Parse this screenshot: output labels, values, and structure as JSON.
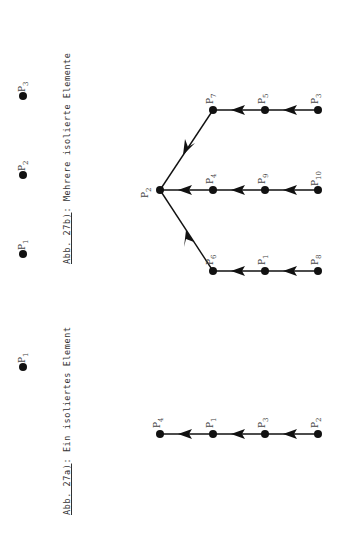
{
  "figure_27a": {
    "caption_ref": "Abb. 27a)",
    "caption_text": ": Ein isoliertes Element",
    "isolated": [
      {
        "label": "P",
        "sub": "1"
      }
    ],
    "chain": [
      {
        "label": "P",
        "sub": "4"
      },
      {
        "label": "P",
        "sub": "1"
      },
      {
        "label": "P",
        "sub": "3"
      },
      {
        "label": "P",
        "sub": "2"
      }
    ]
  },
  "figure_27b": {
    "caption_ref": "Abb. 27b)",
    "caption_text": ": Mehrere isolierte Elemente",
    "isolated": [
      {
        "label": "P",
        "sub": "1"
      },
      {
        "label": "P",
        "sub": "2"
      },
      {
        "label": "P",
        "sub": "3"
      }
    ],
    "tree": {
      "root": {
        "label": "P",
        "sub": "2"
      },
      "branches": [
        [
          {
            "label": "P",
            "sub": "7"
          },
          {
            "label": "P",
            "sub": "5"
          },
          {
            "label": "P",
            "sub": "3"
          }
        ],
        [
          {
            "label": "P",
            "sub": "4"
          },
          {
            "label": "P",
            "sub": "9"
          },
          {
            "label": "P",
            "sub": "10"
          }
        ],
        [
          {
            "label": "P",
            "sub": "6"
          },
          {
            "label": "P",
            "sub": "1"
          },
          {
            "label": "P",
            "sub": "8"
          }
        ]
      ]
    }
  }
}
